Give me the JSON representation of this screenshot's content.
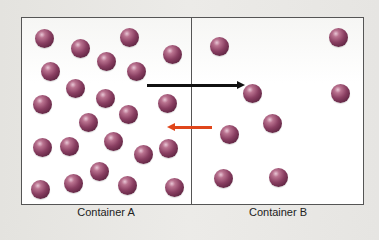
{
  "labels": {
    "container_a": "Container A",
    "container_b": "Container B"
  },
  "colors": {
    "ball": "#7a3a5e",
    "arrow_right": "#111111",
    "arrow_left": "#e0461b",
    "border": "#555555"
  },
  "container_a": {
    "balls": [
      [
        44,
        38
      ],
      [
        80,
        48
      ],
      [
        129,
        37
      ],
      [
        106,
        61
      ],
      [
        136,
        71
      ],
      [
        172,
        54
      ],
      [
        50,
        71
      ],
      [
        75,
        88
      ],
      [
        42,
        104
      ],
      [
        105,
        98
      ],
      [
        128,
        114
      ],
      [
        167,
        103
      ],
      [
        88,
        122
      ],
      [
        42,
        147
      ],
      [
        69,
        146
      ],
      [
        113,
        141
      ],
      [
        143,
        154
      ],
      [
        168,
        148
      ],
      [
        99,
        171
      ],
      [
        40,
        189
      ],
      [
        73,
        183
      ],
      [
        127,
        185
      ],
      [
        174,
        187
      ]
    ]
  },
  "container_b": {
    "balls": [
      [
        219,
        46
      ],
      [
        338,
        37
      ],
      [
        252,
        93
      ],
      [
        340,
        93
      ],
      [
        272,
        123
      ],
      [
        229,
        134
      ],
      [
        223,
        178
      ],
      [
        278,
        177
      ]
    ]
  },
  "arrows": {
    "a_to_b": {
      "x1": 147,
      "x2": 238,
      "y": 85,
      "color": "black"
    },
    "b_to_a": {
      "x1": 212,
      "x2": 168,
      "y": 127,
      "color": "red"
    }
  }
}
